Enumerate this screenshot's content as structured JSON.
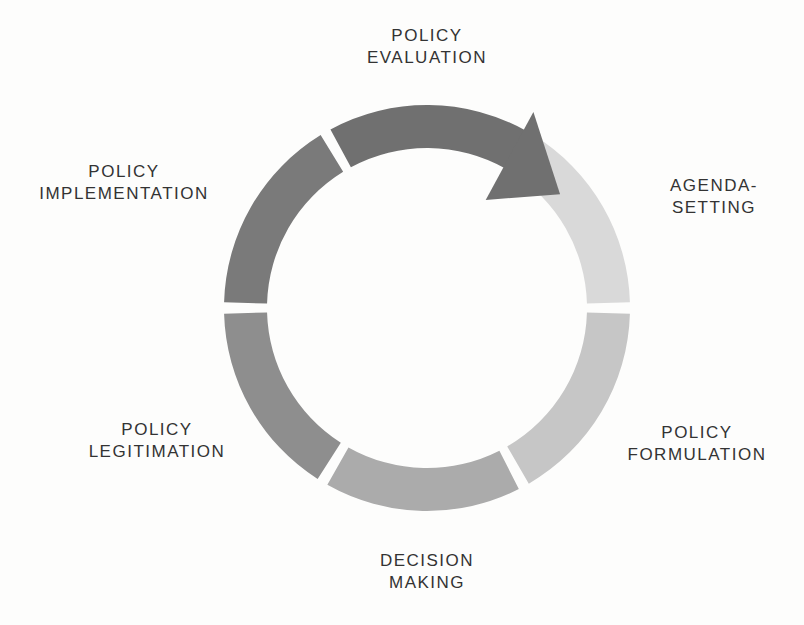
{
  "canvas": {
    "width": 804,
    "height": 625,
    "background": "#fdfdfc"
  },
  "diagram": {
    "type": "cycle",
    "direction": "clockwise",
    "text_color": "#333333",
    "geometry": {
      "cx": 427,
      "cy": 308,
      "outer_radius": 203,
      "inner_radius": 160,
      "gap_degrees": 1.6
    },
    "arrow": {
      "belongs_to": "policy-evaluation",
      "tip_angle": 49.5,
      "tip_radius": 175,
      "base_angle": 28.5,
      "base_outer_radius": 223,
      "base_inner_radius": 123
    },
    "stages": [
      {
        "id": "policy-evaluation",
        "line1": "POLICY",
        "line2": "EVALUATION",
        "color": "#707070",
        "start": 330,
        "end": 389.5,
        "has_arrow": true
      },
      {
        "id": "agenda-setting",
        "line1": "AGENDA-",
        "line2": "SETTING",
        "color": "#d9d9d9",
        "start": 30,
        "end": 90
      },
      {
        "id": "policy-formulation",
        "line1": "POLICY",
        "line2": "FORMULATION",
        "color": "#c6c6c6",
        "start": 90,
        "end": 151.5
      },
      {
        "id": "decision-making",
        "line1": "DECISION",
        "line2": "MAKING",
        "color": "#ababab",
        "start": 151.5,
        "end": 211
      },
      {
        "id": "policy-legitimation",
        "line1": "POLICY",
        "line2": "LEGITIMATION",
        "color": "#8e8e8e",
        "start": 211,
        "end": 270
      },
      {
        "id": "policy-implementation",
        "line1": "POLICY",
        "line2": "IMPLEMENTATION",
        "color": "#7a7a7a",
        "start": 270,
        "end": 330
      }
    ]
  }
}
